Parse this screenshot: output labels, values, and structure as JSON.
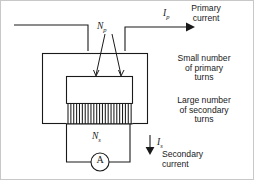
{
  "diagram": {
    "annotations": {
      "primary_current": "Primary\ncurrent",
      "small_primary_turns": "Small number\nof primary\nturns",
      "large_secondary_turns": "Large number\nof secondary\nturns",
      "secondary_current": "Secondary\ncurrent"
    },
    "symbols": {
      "primary_current_symbol": "I",
      "primary_current_subscript": "p",
      "primary_turns_symbol": "N",
      "primary_turns_subscript": "p",
      "secondary_turns_symbol": "N",
      "secondary_turns_subscript": "s",
      "secondary_current_symbol": "I",
      "secondary_current_subscript": "s"
    },
    "meter": {
      "label": "A",
      "name": "ammeter"
    },
    "colors": {
      "line": "#1a1a1a",
      "text": "#1a1a1a",
      "background": "#ffffff",
      "frame": "#c8c8c8"
    },
    "secondary_winding_turn_count": 23
  }
}
